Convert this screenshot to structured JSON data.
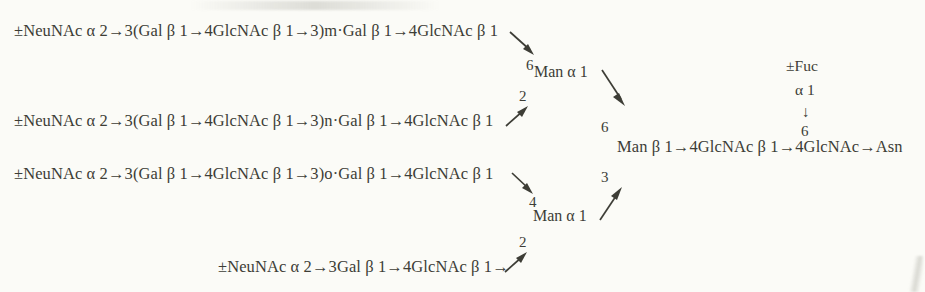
{
  "diagram": {
    "text_color": "#3d3d36",
    "background_color": "#fbfbf7",
    "antenna_chains": [
      {
        "id": "antenna-1",
        "text": "±NeuNAc α 2→3(Gal β 1→4GlcNAc β 1→3)m·Gal β 1→4GlcNAc β 1",
        "repeat": "m",
        "linkage_label": "6",
        "arrow": "down-right"
      },
      {
        "id": "antenna-2",
        "text": "±NeuNAc α 2→3(Gal β 1→4GlcNAc β 1→3)n·Gal β 1→4GlcNAc β 1",
        "repeat": "n",
        "linkage_label": "2",
        "arrow": "up-right"
      },
      {
        "id": "antenna-3",
        "text": "±NeuNAc α 2→3(Gal β 1→4GlcNAc β 1→3)o·Gal β 1→4GlcNAc β 1",
        "repeat": "o",
        "linkage_label": "4",
        "arrow": "down-right"
      },
      {
        "id": "antenna-4",
        "text": "±NeuNAc α 2→3Gal β 1→4GlcNAc β 1→",
        "repeat": "",
        "linkage_label": "2",
        "arrow": "up-right"
      }
    ],
    "mannose_branches": [
      {
        "id": "man-alpha-upper",
        "label": "Man α 1",
        "linkage_label": "6",
        "arrow": "down-right"
      },
      {
        "id": "man-alpha-lower",
        "label": "Man α 1",
        "linkage_label": "3",
        "arrow": "up-right"
      }
    ],
    "core_chain": {
      "id": "core-chain",
      "text": "Man β 1→4GlcNAc β 1→4GlcNAc→Asn",
      "upper_linkage": "6",
      "lower_linkage": "3"
    },
    "fucose_branch": {
      "id": "fucose-branch",
      "residue": "±Fuc",
      "anomeric": "α 1",
      "bond": "↓",
      "position": "6"
    }
  }
}
